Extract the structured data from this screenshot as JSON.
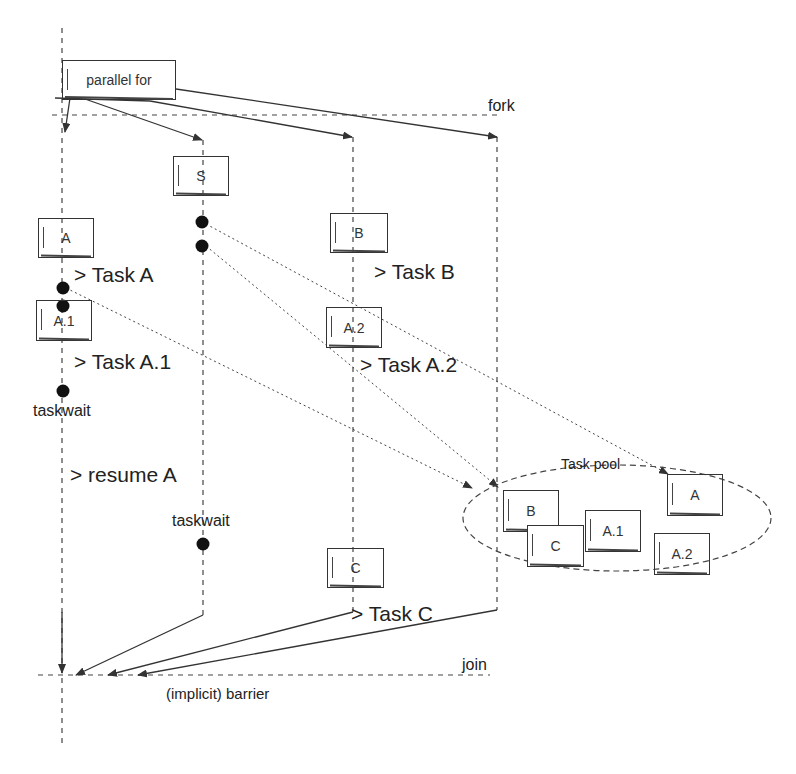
{
  "diagram": {
    "labels": {
      "parallel_for": "parallel for",
      "fork": "fork",
      "join": "join",
      "barrier": "(implicit) barrier",
      "task_pool": "Task pool"
    },
    "thread_tasks": {
      "S": "S",
      "A": "A",
      "A1": "A.1",
      "B": "B",
      "A2": "A.2",
      "C": "C"
    },
    "annotations": {
      "task_a": "> Task A",
      "task_a1": "> Task A.1",
      "taskwait_1": "taskwait",
      "resume_a": "> resume A",
      "taskwait_2": "taskwait",
      "task_b": "> Task B",
      "task_a2": "> Task A.2",
      "task_c": "> Task C"
    },
    "pool_tasks": {
      "B": "B",
      "C": "C",
      "A1": "A.1",
      "A": "A",
      "A2": "A.2"
    },
    "colors": {
      "line": "#333333",
      "background": "#ffffff"
    }
  }
}
